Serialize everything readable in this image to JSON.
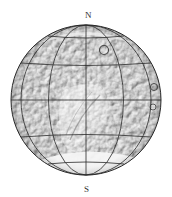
{
  "map": {
    "subject": "planetary globe with latitude/longitude graticule",
    "labels": {
      "north": "N",
      "south": "S"
    },
    "globe": {
      "center_x": 86,
      "center_y": 100,
      "radius": 75
    },
    "graticule": {
      "parallels_deg": [
        -60,
        -30,
        0,
        30,
        60
      ],
      "meridians_deg": [
        -90,
        -60,
        -30,
        0,
        30,
        60,
        90
      ]
    },
    "colors": {
      "background": "#ffffff",
      "surface_base": "#b8b8b8",
      "surface_light": "#ececec",
      "grid_line": "#2a2a2a",
      "polar_cap": "#f4f4f4"
    }
  }
}
